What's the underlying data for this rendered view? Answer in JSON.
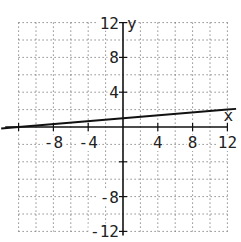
{
  "chart_data": {
    "type": "line",
    "title": "",
    "xlabel": "x",
    "ylabel": "y",
    "xlim": [
      -14,
      13
    ],
    "ylim": [
      -12,
      13
    ],
    "grid": true,
    "grid_step": 2,
    "x_ticks": [
      -8,
      -4,
      4,
      8,
      12
    ],
    "y_ticks": [
      12,
      8,
      4,
      -8,
      -12
    ],
    "x_tick_labels": [
      "-8",
      "-4",
      "4",
      "8",
      "12"
    ],
    "y_tick_labels": [
      "12",
      "8",
      "4",
      "-8",
      "-12"
    ],
    "series": [
      {
        "name": "y = x/12 + 1",
        "x": [
          -14,
          -12,
          0,
          12,
          13
        ],
        "y": [
          -0.1667,
          0,
          1,
          2,
          2.0833
        ]
      }
    ]
  },
  "colors": {
    "line": "#111111",
    "grid": "#555555",
    "axis": "#111111",
    "background": "#ffffff"
  }
}
